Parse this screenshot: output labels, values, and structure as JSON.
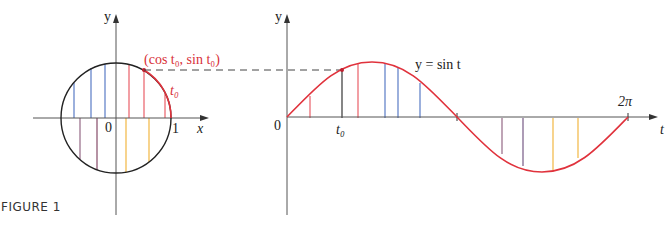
{
  "figure": {
    "caption": "FIGURE 1",
    "circle_plot": {
      "y_axis_label": "y",
      "x_axis_label": "x",
      "origin_label": "0",
      "one_label": "1",
      "point_label": "(cos t₀, sin t₀)",
      "arc_label": "t₀"
    },
    "sine_plot": {
      "y_axis_label": "y",
      "t_axis_label": "t",
      "origin_label": "0",
      "t0_label": "t₀",
      "two_pi_label": "2π",
      "curve_label": "y = sin t"
    },
    "colors": {
      "curve": "#e0323c",
      "circle": "#222222",
      "axis": "#444444",
      "red_lines": "#e8505a",
      "blue_lines": "#4a6fc0",
      "purple_lines": "#7a4a70",
      "yellow_lines": "#f0b030",
      "label_red": "#d83038"
    }
  }
}
